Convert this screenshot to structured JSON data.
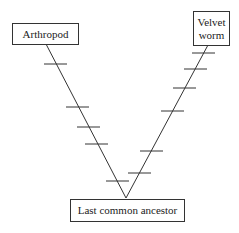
{
  "diagram": {
    "type": "cladogram",
    "nodes": {
      "left_taxon": "Arthropod",
      "right_taxon_line1": "Velvet",
      "right_taxon_line2": "worm",
      "root": "Last common ancestor"
    },
    "branches": [
      {
        "from": "Last common ancestor",
        "to": "Arthropod",
        "tick_marks": 5
      },
      {
        "from": "Last common ancestor",
        "to": "Velvet worm",
        "tick_marks": 6
      }
    ],
    "colors": {
      "line": "#333333",
      "background": "#ffffff"
    }
  }
}
